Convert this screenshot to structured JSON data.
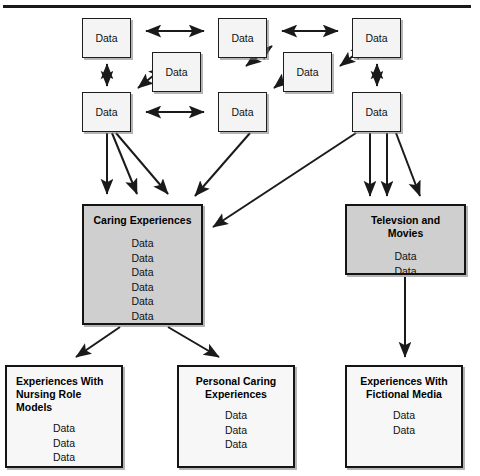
{
  "diagram": {
    "type": "flow-diagram",
    "title_rule": true,
    "generic_label": "Data",
    "colors": {
      "page_background": "#ffffff",
      "node_fill_light": "#f4f4f4",
      "node_fill_shaded": "#cfcfcf",
      "node_border": "#141414",
      "edge": "#1a1a1a",
      "text": "#111111"
    },
    "top_cluster": {
      "name": "data-cluster",
      "nodes": [
        {
          "id": "d1",
          "label": "Data",
          "x": 82,
          "y": 18,
          "w": 49,
          "h": 40
        },
        {
          "id": "d2",
          "label": "Data",
          "x": 152,
          "y": 52,
          "w": 49,
          "h": 40
        },
        {
          "id": "d3",
          "label": "Data",
          "x": 218,
          "y": 18,
          "w": 49,
          "h": 40
        },
        {
          "id": "d4",
          "label": "Data",
          "x": 283,
          "y": 52,
          "w": 49,
          "h": 40
        },
        {
          "id": "d5",
          "label": "Data",
          "x": 352,
          "y": 18,
          "w": 49,
          "h": 40
        },
        {
          "id": "d6",
          "label": "Data",
          "x": 82,
          "y": 92,
          "w": 49,
          "h": 40
        },
        {
          "id": "d7",
          "label": "Data",
          "x": 218,
          "y": 92,
          "w": 49,
          "h": 40
        },
        {
          "id": "d8",
          "label": "Data",
          "x": 352,
          "y": 92,
          "w": 49,
          "h": 40
        }
      ]
    },
    "theme_nodes": [
      {
        "id": "caring",
        "title": "Caring Experiences",
        "title_align": "center",
        "fill": "shaded",
        "items": [
          "Data",
          "Data",
          "Data",
          "Data",
          "Data",
          "Data"
        ],
        "x": 82,
        "y": 204,
        "w": 121,
        "h": 121
      },
      {
        "id": "television",
        "title": "Televsion and Movies",
        "title_align": "center",
        "fill": "shaded",
        "items": [
          "Data",
          "Data"
        ],
        "x": 345,
        "y": 204,
        "w": 121,
        "h": 71
      }
    ],
    "outcome_nodes": [
      {
        "id": "nursing-role-models",
        "title": "Experiences With\nNursing Role Models",
        "title_align": "left",
        "fill": "plain",
        "items": [
          "Data",
          "Data",
          "Data"
        ],
        "x": 5,
        "y": 365,
        "w": 118,
        "h": 103
      },
      {
        "id": "personal-caring",
        "title": "Personal Caring\nExperiences",
        "title_align": "center",
        "fill": "plain",
        "items": [
          "Data",
          "Data",
          "Data"
        ],
        "x": 177,
        "y": 365,
        "w": 118,
        "h": 103
      },
      {
        "id": "fictional-media",
        "title": "Experiences With\nFictional Media",
        "title_align": "center",
        "fill": "plain",
        "items": [
          "Data",
          "Data"
        ],
        "x": 345,
        "y": 365,
        "w": 118,
        "h": 103
      }
    ],
    "connections": {
      "bidirectional_count": 8,
      "directed_count": 11,
      "description": "Double-headed arrows link the eight top Data nodes; single-headed arrows descend from the left and right Data nodes into the two shaded theme nodes, and from the theme nodes into the three outcome nodes."
    }
  }
}
